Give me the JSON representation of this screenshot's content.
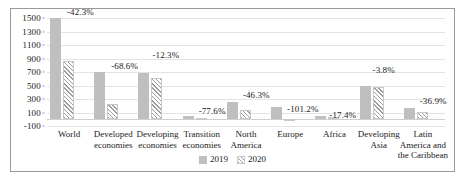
{
  "chart_data": {
    "type": "bar",
    "title": "",
    "subtitle": "",
    "xlabel": "",
    "ylabel": "",
    "ylim": [
      -100,
      1500
    ],
    "ytick_step": 200,
    "yticks": [
      "1500",
      "1300",
      "1100",
      "900",
      "700",
      "500",
      "300",
      "100",
      "-100"
    ],
    "grid": true,
    "legend_position": "bottom-center",
    "categories": [
      "World",
      "Developed economies",
      "Developing economies",
      "Transition economies",
      "North America",
      "Europe",
      "Africa",
      "Developing Asia",
      "Latin America and the Caribbean"
    ],
    "category_lines": [
      [
        "World"
      ],
      [
        "Developed",
        "economies"
      ],
      [
        "Developing",
        "economies"
      ],
      [
        "Transition",
        "economies"
      ],
      [
        "North",
        "America"
      ],
      [
        "Europe"
      ],
      [
        "Africa"
      ],
      [
        "Developing",
        "Asia"
      ],
      [
        "Latin",
        "America and",
        "the Caribbean"
      ]
    ],
    "series": [
      {
        "name": "2019",
        "values": [
          1500,
          700,
          690,
          55,
          250,
          180,
          45,
          500,
          160
        ]
      },
      {
        "name": "2020",
        "values": [
          866,
          220,
          605,
          12,
          134,
          -2,
          37,
          481,
          101
        ]
      }
    ],
    "annotations": [
      "-42.3%",
      "-68.6%",
      "-12.3%",
      "-77.6%",
      "-46.3%",
      "-101.2%",
      "-17.4%",
      "-3.8%",
      "-36.9%"
    ],
    "colors": {
      "series_2019": "#bfbfbf",
      "series_2020_hatch": "#9d9d9d",
      "gridline": "#e3e3e3",
      "frame": "#9a9a9a",
      "text": "#1a1a1a"
    }
  },
  "legend": {
    "items": [
      {
        "label": "2019"
      },
      {
        "label": "2020"
      }
    ]
  }
}
